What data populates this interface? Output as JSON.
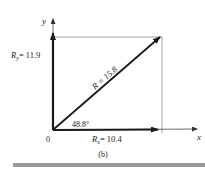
{
  "diagram": {
    "caption": "(b)",
    "origin_label": "0",
    "x_axis_label": "x",
    "y_axis_label": "y",
    "resultant": {
      "symbol": "R",
      "label": "R = 15.8",
      "value": 15.8
    },
    "x_component": {
      "symbol": "R",
      "subscript": "x",
      "label_suffix": "= 10.4",
      "value": 10.4
    },
    "y_component": {
      "symbol": "R",
      "subscript": "y",
      "label_suffix": "= 11.9",
      "value": 11.9
    },
    "angle": {
      "label": "48.8°",
      "value": 48.8
    },
    "colors": {
      "vector": "#1a1a1a",
      "guide": "#888888",
      "bar": "#9a9a9a"
    }
  }
}
